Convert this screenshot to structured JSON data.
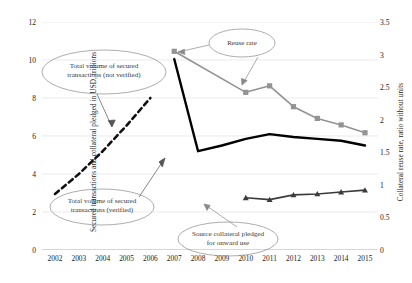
{
  "chart_data": {
    "type": "line",
    "title": "",
    "xlabel": "",
    "ylabel": "Secured transactions and collateral pledged in USD, trillions",
    "y2label": "Collateral reuse rate, ratio without units",
    "categories": [
      2002,
      2003,
      2004,
      2005,
      2006,
      2007,
      2008,
      2009,
      2010,
      2011,
      2012,
      2013,
      2014,
      2015
    ],
    "xtick_labels": [
      "2002",
      "2003",
      "2004",
      "2005",
      "2006",
      "2007",
      "2008",
      "2009",
      "2010",
      "2011",
      "2012",
      "2013",
      "2014",
      "2015"
    ],
    "ylim": [
      0,
      12
    ],
    "ytick_labels": [
      "0",
      "2",
      "4",
      "6",
      "8",
      "10",
      "12"
    ],
    "ytick_values": [
      0,
      2,
      4,
      6,
      8,
      10,
      12
    ],
    "y2lim": [
      0,
      3.5
    ],
    "y2tick_labels": [
      "0",
      "0.5",
      "1",
      "1.5",
      "2",
      "2.5",
      "3",
      "3.5"
    ],
    "y2tick_values": [
      0,
      0.5,
      1,
      1.5,
      2,
      2.5,
      3,
      3.5
    ],
    "grid": true,
    "legend_position": "none",
    "series": [
      {
        "name": "Total volume of secured transactions (not verified)",
        "axis": "left",
        "style": "dashed",
        "color": "#111111",
        "marker": "none",
        "x": [
          2002,
          2003,
          2004,
          2005,
          2006
        ],
        "values": [
          2.95,
          4.0,
          5.2,
          6.55,
          8.0
        ]
      },
      {
        "name": "Total volume of secured transactions (verified)",
        "axis": "left",
        "style": "solid-thick",
        "color": "#000000",
        "marker": "none",
        "x": [
          2007,
          2008,
          2009,
          2010,
          2011,
          2012,
          2013,
          2014,
          2015
        ],
        "values": [
          10.05,
          5.2,
          5.5,
          5.85,
          6.1,
          5.95,
          5.85,
          5.75,
          5.5
        ]
      },
      {
        "name": "Reuse rate",
        "axis": "right",
        "style": "solid",
        "color": "#939393",
        "marker": "square",
        "x": [
          2007,
          2010,
          2011,
          2012,
          2013,
          2014,
          2015
        ],
        "values": [
          3.05,
          2.42,
          2.52,
          2.2,
          2.02,
          1.92,
          1.8
        ]
      },
      {
        "name": "Source collateral pledged for onward use",
        "axis": "left",
        "style": "solid",
        "color": "#3b3b3b",
        "marker": "triangle",
        "x": [
          2010,
          2011,
          2012,
          2013,
          2014,
          2015
        ],
        "values": [
          2.75,
          2.65,
          2.9,
          2.95,
          3.05,
          3.15
        ]
      }
    ],
    "annotations": [
      {
        "name": "not-verified",
        "line1": "Total volume of secured",
        "line2": "transactions (not verified)",
        "shape": "ellipse"
      },
      {
        "name": "verified",
        "line1": "Total volume of secured",
        "line2": "transactions (verified)",
        "shape": "ellipse"
      },
      {
        "name": "reuse-rate",
        "line1": "Reuse rate",
        "line2": "",
        "shape": "ellipse"
      },
      {
        "name": "source-collateral",
        "line1": "Source collateral pledged",
        "line2": "for onward use",
        "shape": "ellipse"
      }
    ]
  }
}
